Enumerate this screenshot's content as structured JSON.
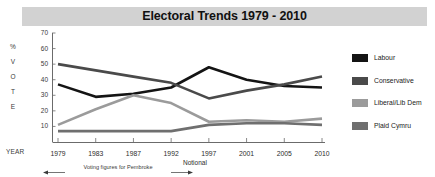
{
  "title": "Electoral Trends 1979 - 2010",
  "axis": {
    "y_label_letters": [
      "%",
      "V",
      "O",
      "T",
      "E"
    ],
    "year_label": "YEAR"
  },
  "annotations": {
    "notional": "Notional",
    "pembroke": "Voting figures for Pembroke"
  },
  "colors": {
    "title_band": "#d2d2d2",
    "labour": "#141414",
    "conservative": "#4a4a4a",
    "liberal": "#9b9b9b",
    "plaid": "#6f6f6f",
    "axis": "#6b6b6b"
  },
  "legend": [
    {
      "label": "Labour",
      "color": "#141414"
    },
    {
      "label": "Conservative",
      "color": "#4a4a4a"
    },
    {
      "label": "Liberal/Lib Dem",
      "color": "#9b9b9b"
    },
    {
      "label": "Plaid Cymru",
      "color": "#6f6f6f"
    }
  ],
  "chart_data": {
    "type": "line",
    "title": "Electoral Trends 1979 - 2010",
    "xlabel": "YEAR",
    "ylabel": "% VOTE",
    "categories": [
      "1979",
      "1983",
      "1987",
      "1992",
      "1997",
      "2001",
      "2005",
      "2010"
    ],
    "ylim": [
      0,
      70
    ],
    "yticks": [
      10,
      20,
      30,
      40,
      50,
      60,
      70
    ],
    "grid": false,
    "legend_position": "right",
    "series": [
      {
        "name": "Labour",
        "color": "#141414",
        "values": [
          37,
          29,
          31,
          35,
          48,
          40,
          36,
          35
        ]
      },
      {
        "name": "Conservative",
        "color": "#4a4a4a",
        "values": [
          50,
          46,
          42,
          38,
          28,
          33,
          37,
          42
        ]
      },
      {
        "name": "Liberal/Lib Dem",
        "color": "#9b9b9b",
        "values": [
          11,
          21,
          30,
          25,
          13,
          14,
          13,
          15
        ]
      },
      {
        "name": "Plaid Cymru",
        "color": "#6f6f6f",
        "values": [
          7,
          7,
          7,
          7,
          11,
          12,
          12,
          11
        ]
      }
    ],
    "annotations": [
      {
        "text": "Voting figures for Pembroke",
        "span": [
          "1979",
          "1992"
        ]
      },
      {
        "text": "Notional",
        "at": "1992"
      }
    ]
  }
}
